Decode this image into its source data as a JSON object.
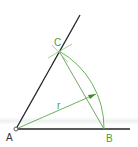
{
  "diagram": {
    "points": {
      "A": {
        "label": "A",
        "x": 16,
        "y": 129
      },
      "B": {
        "label": "B",
        "x": 104,
        "y": 129
      },
      "C": {
        "label": "C",
        "x": 59,
        "y": 51
      }
    },
    "radius_label": "r",
    "colors": {
      "construction": "#5aa84a",
      "line": "#222222",
      "label_A": "#333333",
      "label_green": "#4a9a3a"
    }
  }
}
